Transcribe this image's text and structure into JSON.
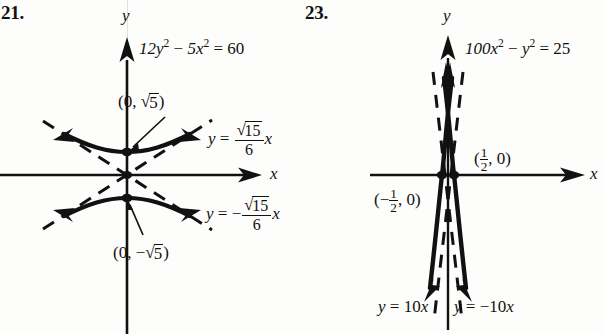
{
  "page": {
    "background_color": "#fdfdfc",
    "ink_color": "#111111",
    "type": "textbook-answer-figures"
  },
  "figures": [
    {
      "number_label": "21.",
      "equation": "12y² − 5x² = 60",
      "equation_parts": {
        "lhs_a": "12y",
        "exp1": "2",
        "minus": "−",
        "lhs_b": "5x",
        "exp2": "2",
        "eq": "=",
        "rhs": "60"
      },
      "axis_x_label": "x",
      "axis_y_label": "y",
      "vertex_top_label": "(0, √5)",
      "vertex_bottom_label": "(0, −√5)",
      "asymptote_pos_label": "y = √15/6 x",
      "asymptote_neg_label": "y = −√15/6 x",
      "asymptote_numerator": "15",
      "asymptote_denominator": "6",
      "curve_type": "hyperbola-vertical-transverse",
      "vertices": [
        "(0, 2.236)",
        "(0, -2.236)"
      ],
      "asymptote_slope": "0.6455"
    },
    {
      "number_label": "23.",
      "equation": "100x² − y² = 25",
      "equation_parts": {
        "lhs_a": "100x",
        "exp1": "2",
        "minus": "−",
        "lhs_b": "y",
        "exp2": "2",
        "eq": "=",
        "rhs": "25"
      },
      "axis_x_label": "x",
      "axis_y_label": "y",
      "vertex_right_label": "(1/2, 0)",
      "vertex_left_label": "(−1/2, 0)",
      "asymptote_pos_label": "y = 10x",
      "asymptote_neg_label": "y = −10x",
      "curve_type": "hyperbola-horizontal-transverse",
      "vertices": [
        "(0.5, 0)",
        "(-0.5, 0)"
      ],
      "asymptote_slope": "10"
    }
  ]
}
